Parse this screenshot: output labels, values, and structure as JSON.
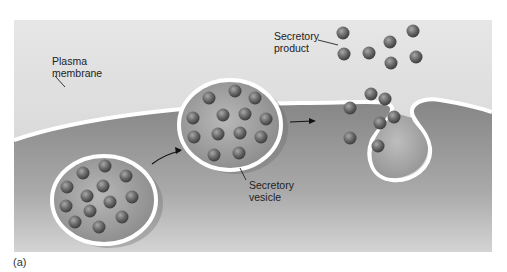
{
  "figure": {
    "panel_label": "(a)",
    "labels": {
      "plasma_membrane_line1": "Plasma",
      "plasma_membrane_line2": "membrane",
      "secretory_product_line1": "Secretory",
      "secretory_product_line2": "product",
      "secretory_vesicle_line1": "Secretory",
      "secretory_vesicle_line2": "vesicle"
    },
    "stages": [
      {
        "name": "vesicle-in-cytoplasm",
        "granules": 15
      },
      {
        "name": "vesicle-docking-at-membrane",
        "granules": 14
      },
      {
        "name": "exocytosis-fusion",
        "granules": 7
      }
    ],
    "released_granules": 7,
    "colors": {
      "extracellular": "#d9d9d9",
      "cytoplasm": "#8c8c8c",
      "membrane": "#ffffff",
      "granule": "#6e6e6e"
    }
  }
}
